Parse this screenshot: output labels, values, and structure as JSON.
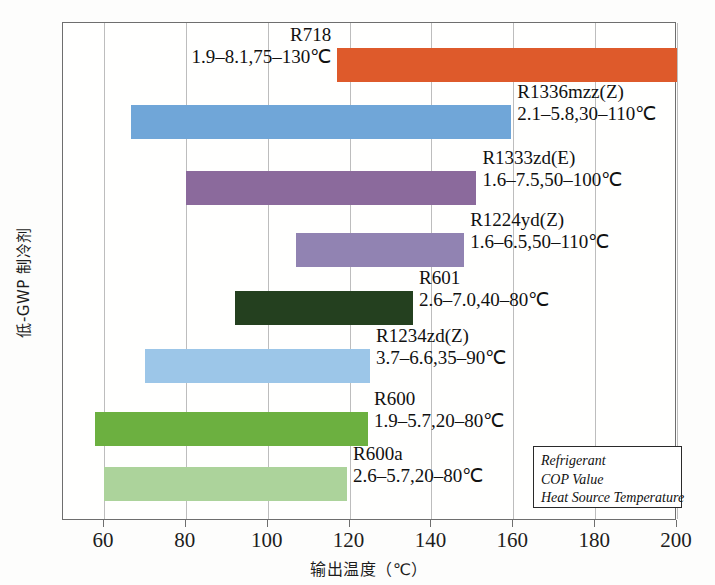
{
  "chart_data": {
    "type": "bar",
    "orientation": "horizontal-range",
    "title": "",
    "xlabel": "输出温度（℃）",
    "ylabel": "低-GWP 制冷剂",
    "xlim": [
      50,
      210
    ],
    "xticks": [
      60,
      80,
      100,
      120,
      140,
      160,
      180,
      200
    ],
    "xticklabels": [
      "60",
      "80",
      "100",
      "120",
      "140",
      "160",
      "180",
      "200"
    ],
    "grid": "vertical",
    "legend": {
      "position": "bottom-right",
      "lines": [
        "Refrigerant",
        "COP Value",
        "Heat Source Temperature"
      ]
    },
    "categories": [
      "R718",
      "R1336mzz(Z)",
      "R1333zd(E)",
      "R1224yd(Z)",
      "R601",
      "R1234zd(Z)",
      "R600",
      "R600a"
    ],
    "bars": [
      {
        "name": "R718",
        "cop": "1.9–8.1",
        "heat_source": "75–130℃",
        "meta": "1.9–8.1,75–130℃",
        "x_start": 117,
        "x_end": 200,
        "color": "#de5a2b",
        "label_side": "left"
      },
      {
        "name": "R1336mzz(Z)",
        "cop": "2.1–5.8",
        "heat_source": "30–110℃",
        "meta": "2.1–5.8,30–110℃",
        "x_start": 66.5,
        "x_end": 159.5,
        "color": "#70a6d8",
        "label_side": "right"
      },
      {
        "name": "R1333zd(E)",
        "cop": "1.6–7.5",
        "heat_source": "50–100℃",
        "meta": "1.6–7.5,50–100℃",
        "x_start": 80,
        "x_end": 151,
        "color": "#8b6a9c",
        "label_side": "right"
      },
      {
        "name": "R1224yd(Z)",
        "cop": "1.6–6.5",
        "heat_source": "50–110℃",
        "meta": "1.6–6.5,50–110℃",
        "x_start": 107,
        "x_end": 148,
        "color": "#9183b2",
        "label_side": "right"
      },
      {
        "name": "R601",
        "cop": "2.6–7.0",
        "heat_source": "40–80℃",
        "meta": "2.6–7.0,40–80℃",
        "x_start": 92,
        "x_end": 135.5,
        "color": "#24401f",
        "label_side": "right"
      },
      {
        "name": "R1234zd(Z)",
        "cop": "3.7–6.6",
        "heat_source": "35–90℃",
        "meta": "3.7–6.6,35–90℃",
        "x_start": 70,
        "x_end": 125,
        "color": "#9cc6e8",
        "label_side": "right"
      },
      {
        "name": "R600",
        "cop": "1.9–5.7",
        "heat_source": "20–80℃",
        "meta": "1.9–5.7,20–80℃",
        "x_start": 57.8,
        "x_end": 124.5,
        "color": "#6cb040",
        "label_side": "right"
      },
      {
        "name": "R600a",
        "cop": "2.6–5.7",
        "heat_source": "20–80℃",
        "meta": "2.6–5.7,20–80℃",
        "x_start": 60,
        "x_end": 119.4,
        "color": "#acd39b",
        "label_side": "right"
      }
    ]
  }
}
